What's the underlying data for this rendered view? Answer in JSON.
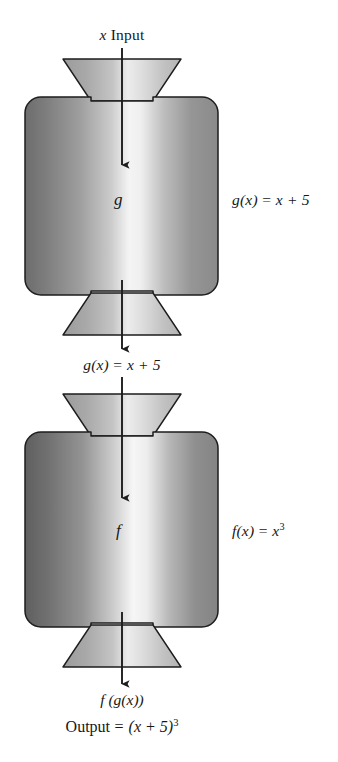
{
  "diagram": {
    "type": "flow-diagram",
    "background_color": "#ffffff",
    "ink_color": "#171717"
  },
  "labels": {
    "input": "x Input",
    "input_var": "x",
    "input_word": "Input",
    "machine_g_letter": "g",
    "machine_f_letter": "f",
    "rule_g": "g(x) = x + 5",
    "rule_f": "f(x) = x³",
    "intermediate": "g(x) = x + 5",
    "output_composite": "f (g(x))",
    "output_value": "Output = (x + 5)³"
  },
  "parts": {
    "rule_g_lhs": "g(x)",
    "rule_g_eq": "=",
    "rule_g_rhs": "x + 5",
    "rule_f_lhs": "f(x)",
    "rule_f_eq": "=",
    "rule_f_base": "x",
    "rule_f_exp": "3",
    "out_word": "Output",
    "out_eq": "=",
    "out_base": "(x + 5)",
    "out_exp": "3"
  },
  "machines": [
    {
      "name": "g",
      "rule": "g(x) = x + 5",
      "input": "x",
      "output": "g(x) = x + 5",
      "order": 1
    },
    {
      "name": "f",
      "rule": "f(x) = x³",
      "input": "g(x) = x + 5",
      "output": "f (g(x))",
      "order": 2
    }
  ],
  "colors": {
    "outline": "#1d1d1d",
    "gradient_dark": "#6f6f6f",
    "gradient_mid": "#a9a9a9",
    "gradient_light": "#f2f2f2",
    "hopper_dark": "#9a9a9a",
    "hopper_light": "#ececec",
    "arrow": "#1d1d1d"
  },
  "geometry": {
    "canvas_width": 338,
    "canvas_height": 762,
    "center_x": 122,
    "box1": {
      "x": 25,
      "y": 97,
      "width": 193,
      "height": 198,
      "radius": 16
    },
    "box2": {
      "x": 25,
      "y": 432,
      "width": 193,
      "height": 195,
      "radius": 16
    },
    "hopper_top_width": 118,
    "hopper_bottom_width": 62,
    "hopper_height": 42
  },
  "arrows": [
    {
      "name": "input-arrow",
      "from_y": 48,
      "to_y": 167,
      "x": 122
    },
    {
      "name": "g-output-arrow",
      "from_y": 282,
      "to_y": 350,
      "x": 122
    },
    {
      "name": "f-input-arrow",
      "from_y": 378,
      "to_y": 500,
      "x": 122
    },
    {
      "name": "f-output-arrow",
      "from_y": 613,
      "to_y": 685,
      "x": 122
    }
  ]
}
